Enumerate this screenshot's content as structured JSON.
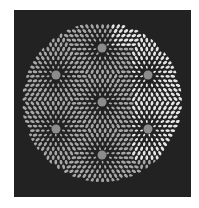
{
  "artwork": {
    "background": "#ffffff",
    "canvas_color": "#222222",
    "petal_color": "#a8a8a8",
    "bright_petal_color": "#e6e6e6",
    "center_color": "#8c8c8c",
    "circle": {
      "cx": 102,
      "cy": 102,
      "r": 80
    },
    "rosettes": [
      {
        "name": "center",
        "cx": 102,
        "cy": 102
      },
      {
        "name": "top",
        "cx": 102,
        "cy": 48
      },
      {
        "name": "bottom",
        "cx": 102,
        "cy": 155
      },
      {
        "name": "upper-left",
        "cx": 56,
        "cy": 75
      },
      {
        "name": "upper-right",
        "cx": 148,
        "cy": 75
      },
      {
        "name": "lower-left",
        "cx": 56,
        "cy": 129
      },
      {
        "name": "lower-right",
        "cx": 148,
        "cy": 129
      }
    ]
  }
}
